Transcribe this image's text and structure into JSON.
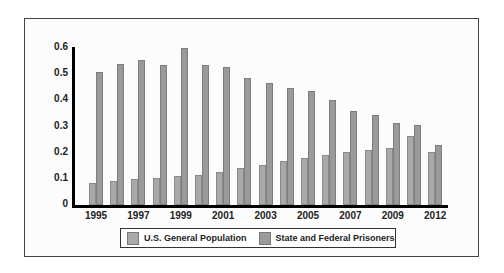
{
  "chart_data": {
    "type": "bar",
    "title": "",
    "xlabel": "",
    "ylabel": "",
    "ylim": [
      0,
      0.6
    ],
    "yticks": [
      "0",
      "0.1",
      "0.2",
      "0.3",
      "0.4",
      "0.5",
      "0.6"
    ],
    "categories": [
      "1995",
      "1996",
      "1997",
      "1998",
      "1999",
      "2000",
      "2001",
      "2002",
      "2003",
      "2004",
      "2005",
      "2006",
      "2007",
      "2008",
      "2009",
      "2010",
      "2012"
    ],
    "xtick_labels": [
      "1995",
      "1997",
      "1999",
      "2001",
      "2003",
      "2005",
      "2007",
      "2009",
      "2012"
    ],
    "series": [
      {
        "name": "U.S. General Population",
        "values": [
          0.084,
          0.092,
          0.099,
          0.103,
          0.11,
          0.115,
          0.126,
          0.141,
          0.153,
          0.168,
          0.179,
          0.191,
          0.202,
          0.21,
          0.218,
          0.263,
          0.202
        ]
      },
      {
        "name": "State and Federal Prisoners",
        "values": [
          0.508,
          0.538,
          0.553,
          0.534,
          0.6,
          0.534,
          0.527,
          0.485,
          0.466,
          0.447,
          0.435,
          0.4,
          0.359,
          0.343,
          0.313,
          0.305,
          0.229
        ]
      }
    ],
    "legend_position": "bottom",
    "grid": false
  },
  "legend": {
    "general_label": "U.S. General Population",
    "prisoners_label": "State and Federal Prisoners"
  }
}
